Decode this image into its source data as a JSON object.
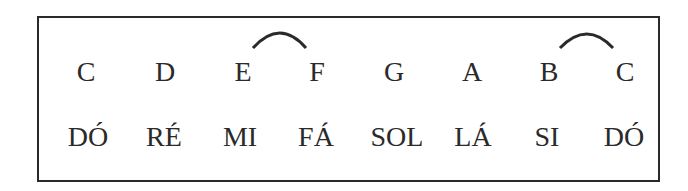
{
  "diagram": {
    "letters": [
      "C",
      "D",
      "E",
      "F",
      "G",
      "A",
      "B",
      "C"
    ],
    "solfege": [
      "DÓ",
      "RÉ",
      "MI",
      "FÁ",
      "SOL",
      "LÁ",
      "SI",
      "DÓ"
    ],
    "semitone_arcs": [
      {
        "from": "E",
        "to": "F"
      },
      {
        "from": "B",
        "to": "C"
      }
    ]
  }
}
